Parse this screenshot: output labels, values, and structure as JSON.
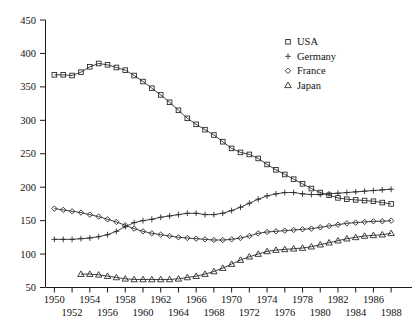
{
  "chart_data": {
    "type": "line",
    "title": "",
    "subtitle": "",
    "xlabel": "",
    "ylabel": "",
    "xlim": [
      1949,
      1989
    ],
    "ylim": [
      50,
      450
    ],
    "grid": false,
    "legend_position": "top-right",
    "x_ticks": [
      1950,
      1952,
      1954,
      1956,
      1958,
      1960,
      1962,
      1964,
      1966,
      1968,
      1970,
      1972,
      1974,
      1976,
      1978,
      1980,
      1982,
      1984,
      1986,
      1988
    ],
    "x_tick_labels": [
      "1950",
      "1952",
      "1954",
      "1956",
      "1958",
      "1960",
      "1962",
      "1964",
      "1966",
      "1968",
      "1970",
      "1972",
      "1974",
      "1976",
      "1978",
      "1980",
      "1982",
      "1984",
      "1986",
      "1988"
    ],
    "y_ticks": [
      50,
      100,
      150,
      200,
      250,
      300,
      350,
      400,
      450
    ],
    "y_tick_labels": [
      "50",
      "100",
      "150",
      "200",
      "250",
      "300",
      "350",
      "400",
      "450"
    ],
    "series": [
      {
        "name": "USA",
        "marker": "square",
        "legend_glyph": "square",
        "x": [
          1950,
          1951,
          1952,
          1953,
          1954,
          1955,
          1956,
          1957,
          1958,
          1959,
          1960,
          1961,
          1962,
          1963,
          1964,
          1965,
          1966,
          1967,
          1968,
          1969,
          1970,
          1971,
          1972,
          1973,
          1974,
          1975,
          1976,
          1977,
          1978,
          1979,
          1980,
          1981,
          1982,
          1983,
          1984,
          1985,
          1986,
          1987,
          1988
        ],
        "values": [
          368,
          368,
          367,
          372,
          380,
          385,
          383,
          379,
          375,
          367,
          358,
          348,
          338,
          327,
          315,
          303,
          294,
          286,
          278,
          268,
          258,
          252,
          249,
          243,
          234,
          226,
          219,
          212,
          205,
          198,
          192,
          188,
          184,
          182,
          181,
          180,
          179,
          177,
          175
        ]
      },
      {
        "name": "Germany",
        "marker": "plus",
        "legend_glyph": "plus",
        "x": [
          1950,
          1951,
          1952,
          1953,
          1954,
          1955,
          1956,
          1957,
          1958,
          1959,
          1960,
          1961,
          1962,
          1963,
          1964,
          1965,
          1966,
          1967,
          1968,
          1969,
          1970,
          1971,
          1972,
          1973,
          1974,
          1975,
          1976,
          1977,
          1978,
          1979,
          1980,
          1981,
          1982,
          1983,
          1984,
          1985,
          1986,
          1987,
          1988
        ],
        "values": [
          122,
          122,
          122,
          123,
          124,
          126,
          129,
          134,
          141,
          147,
          150,
          152,
          155,
          157,
          159,
          161,
          161,
          159,
          159,
          161,
          165,
          170,
          176,
          182,
          187,
          190,
          192,
          192,
          190,
          189,
          189,
          190,
          191,
          192,
          193,
          194,
          195,
          196,
          197
        ]
      },
      {
        "name": "France",
        "marker": "diamond",
        "legend_glyph": "diamond",
        "x": [
          1950,
          1951,
          1952,
          1953,
          1954,
          1955,
          1956,
          1957,
          1958,
          1959,
          1960,
          1961,
          1962,
          1963,
          1964,
          1965,
          1966,
          1967,
          1968,
          1969,
          1970,
          1971,
          1972,
          1973,
          1974,
          1975,
          1976,
          1977,
          1978,
          1979,
          1980,
          1981,
          1982,
          1983,
          1984,
          1985,
          1986,
          1987,
          1988
        ],
        "values": [
          168,
          166,
          164,
          162,
          159,
          156,
          152,
          148,
          143,
          138,
          134,
          131,
          129,
          127,
          125,
          124,
          123,
          122,
          121,
          121,
          122,
          124,
          127,
          131,
          133,
          134,
          135,
          136,
          137,
          138,
          140,
          142,
          144,
          146,
          147,
          148,
          149,
          149,
          150
        ]
      },
      {
        "name": "Japan",
        "marker": "triangle",
        "legend_glyph": "triangle",
        "x": [
          1953,
          1954,
          1955,
          1956,
          1957,
          1958,
          1959,
          1960,
          1961,
          1962,
          1963,
          1964,
          1965,
          1966,
          1967,
          1968,
          1969,
          1970,
          1971,
          1972,
          1973,
          1974,
          1975,
          1976,
          1977,
          1978,
          1979,
          1980,
          1981,
          1982,
          1983,
          1984,
          1985,
          1986,
          1987,
          1988
        ],
        "values": [
          70,
          70,
          69,
          67,
          65,
          63,
          62,
          62,
          62,
          62,
          62,
          63,
          65,
          67,
          70,
          74,
          79,
          85,
          91,
          96,
          100,
          104,
          106,
          107,
          108,
          109,
          111,
          114,
          117,
          120,
          123,
          125,
          127,
          128,
          129,
          131
        ]
      }
    ]
  },
  "legend": {
    "items": [
      {
        "label": "USA"
      },
      {
        "label": "Germany"
      },
      {
        "label": "France"
      },
      {
        "label": "Japan"
      }
    ]
  }
}
